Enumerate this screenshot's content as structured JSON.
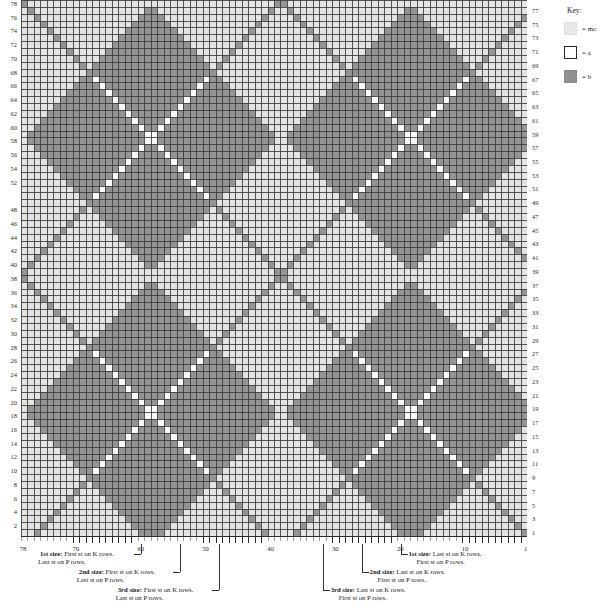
{
  "key": {
    "title": "Key:",
    "entries": [
      {
        "name": "mc",
        "label": "= mc",
        "color": "#e8e8e8",
        "border": "#e0e0e0",
        "swatch_style": "fill"
      },
      {
        "name": "a",
        "label": "= a",
        "color": "#ffffff",
        "border": "#2a2a2a",
        "swatch_style": "outline"
      },
      {
        "name": "b",
        "label": "= b",
        "color": "#909090",
        "border": "#8a8a8a",
        "swatch_style": "fill"
      }
    ]
  },
  "chart_data": {
    "type": "heatmap",
    "columns": 78,
    "rows": 78,
    "cell_px": 6.487,
    "grid_line_color": "#3a3a3a",
    "palette": {
      "mc": "#e4e4e4",
      "a": "#fbfbfb",
      "b": "#949494"
    },
    "xlabel": "stitches",
    "ylabel": "rows",
    "x_tick_labels": [
      "78",
      "70",
      "60",
      "50",
      "40",
      "30",
      "20",
      "10",
      "1"
    ],
    "x_tick_values": [
      78,
      70,
      60,
      50,
      40,
      30,
      20,
      10,
      1
    ],
    "y_left_labels": [
      78,
      76,
      74,
      72,
      70,
      68,
      66,
      64,
      62,
      60,
      58,
      56,
      54,
      52,
      48,
      46,
      44,
      42,
      40,
      38,
      36,
      34,
      32,
      30,
      28,
      26,
      24,
      22,
      20,
      18,
      16,
      14,
      12,
      10,
      8,
      6,
      4,
      2
    ],
    "y_right_labels": [
      77,
      75,
      73,
      71,
      69,
      67,
      65,
      63,
      61,
      59,
      57,
      55,
      53,
      51,
      49,
      47,
      45,
      43,
      41,
      39,
      37,
      35,
      33,
      31,
      29,
      27,
      25,
      23,
      21,
      19,
      17,
      15,
      13,
      11,
      9,
      7,
      5,
      3,
      1
    ],
    "pattern": {
      "description": "Argyle: diamond lattice of half-period 20 sts / 20 rows. Large b diamonds centred at (col,row) grid-phase offsets; thin single-cell b diagonals crossing the a (white) background; light mc fills the off-diamond quadrants.",
      "diamond_half_width": 20,
      "diamond_half_height": 20,
      "center_col": 39,
      "center_row": 39,
      "big_diamond_radius": 19,
      "thin_line_width": 1
    }
  },
  "column_numbers": [
    {
      "label": "78",
      "col": 78,
      "anchor": "left"
    },
    {
      "label": "70",
      "col": 70,
      "anchor": "center"
    },
    {
      "label": "60",
      "col": 60,
      "anchor": "center"
    },
    {
      "label": "50",
      "col": 50,
      "anchor": "center"
    },
    {
      "label": "40",
      "col": 40,
      "anchor": "center"
    },
    {
      "label": "30",
      "col": 30,
      "anchor": "center"
    },
    {
      "label": "20",
      "col": 20,
      "anchor": "center"
    },
    {
      "label": "10",
      "col": 10,
      "anchor": "center"
    },
    {
      "label": "1",
      "col": 1,
      "anchor": "right"
    }
  ],
  "size_notes_left": [
    {
      "id": "left-1st",
      "size_label": "1st size:",
      "line1": " First st on K rows.",
      "line2": "Last st on P rows.",
      "marker_col": 60
    },
    {
      "id": "left-2nd",
      "size_label": "2nd size:",
      "line1": " First st on K rows.",
      "line2": "Last st on P rows.",
      "marker_col": 54
    },
    {
      "id": "left-3rd",
      "size_label": "3rd size:",
      "line1": " First st on K rows.",
      "line2": "Last st on P rows.",
      "marker_col": 48
    }
  ],
  "size_notes_right": [
    {
      "id": "right-1st",
      "size_label": "1st size:",
      "line1": " Last st on K rows.",
      "line2": "First st on P rows.",
      "marker_col": 20
    },
    {
      "id": "right-2nd",
      "size_label": "2nd size:",
      "line1": " Last st on K rows.",
      "line2": "First st on P rows.",
      "marker_col": 26
    },
    {
      "id": "right-3rd",
      "size_label": "3rd size:",
      "line1": " Last st on K rows.",
      "line2": "First st on P rows.",
      "marker_col": 32
    }
  ]
}
